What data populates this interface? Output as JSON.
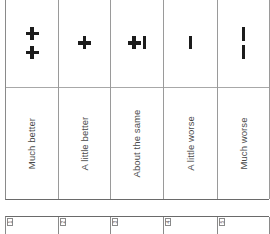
{
  "scale": {
    "columns": [
      {
        "index": 1,
        "symbol": "++",
        "symbol_name": "double-plus-icon",
        "label": "Much better"
      },
      {
        "index": 2,
        "symbol": "+",
        "symbol_name": "plus-icon",
        "label": "A little better"
      },
      {
        "index": 3,
        "symbol": "+|",
        "symbol_name": "plus-minus-icon",
        "label": "About the same"
      },
      {
        "index": 4,
        "symbol": "|",
        "symbol_name": "minus-icon",
        "label": "A little worse"
      },
      {
        "index": 5,
        "symbol": "||",
        "symbol_name": "double-minus-icon",
        "label": "Much worse"
      }
    ]
  },
  "answer_boxes": [
    {
      "number": "1"
    },
    {
      "number": "2"
    },
    {
      "number": "3"
    },
    {
      "number": "4"
    },
    {
      "number": "5"
    }
  ],
  "colors": {
    "ink": "#1c1c1c",
    "label_text": "#4a4a4a",
    "grid": "#9a9a9a",
    "background": "#ffffff"
  }
}
